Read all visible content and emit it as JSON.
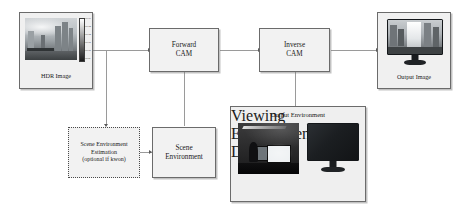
{
  "diagram": {
    "background_color": "#ffffff",
    "box_fill": "#f2f2f2",
    "box_border": "#6b6b6b",
    "connector_color": "#9a9a9a",
    "arrow_color": "#5a5a5a"
  },
  "nodes": {
    "hdr_image": {
      "label": "HDR Image",
      "icon": "hdr-photograph-with-colorbar"
    },
    "forward_cam": {
      "label": "Forward\nCAM"
    },
    "inverse_cam": {
      "label": "Inverse\nCAM"
    },
    "output_image": {
      "label": "Output Image",
      "icon": "monitor-displaying-image"
    },
    "scene_env_estimation": {
      "label": "Scene Environment\nEstimation\n(optional if kwon)",
      "border_style": "dotted"
    },
    "scene_environment": {
      "label": "Scene\nEnvironment"
    },
    "output_environment": {
      "title": "Output Environment",
      "items": [
        {
          "label": "Viewing Environment",
          "icon": "room-photograph"
        },
        {
          "label": "Display",
          "icon": "monitor-icon"
        }
      ]
    }
  },
  "colorbar": {
    "ticks": [
      "1.0e+04",
      "1.0e+03",
      "1.0e+02",
      "1.0e+01",
      "1.0e+00",
      "1.0e-01"
    ]
  },
  "edges": [
    {
      "from": "hdr_image",
      "to": "forward_cam",
      "direction": "right"
    },
    {
      "from": "hdr_image",
      "to": "scene_env_estimation",
      "direction": "down"
    },
    {
      "from": "scene_env_estimation",
      "to": "scene_environment",
      "direction": "right"
    },
    {
      "from": "scene_environment",
      "to": "forward_cam",
      "direction": "up"
    },
    {
      "from": "forward_cam",
      "to": "inverse_cam",
      "direction": "right"
    },
    {
      "from": "output_environment",
      "to": "inverse_cam",
      "direction": "up"
    },
    {
      "from": "inverse_cam",
      "to": "output_image",
      "direction": "right"
    }
  ]
}
